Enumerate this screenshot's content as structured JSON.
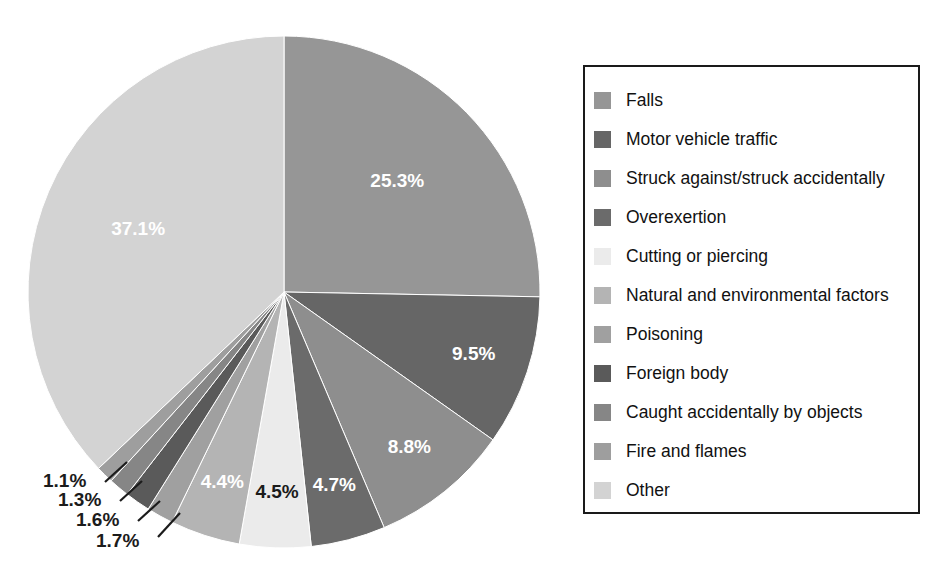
{
  "chart_data": {
    "type": "pie",
    "title": "",
    "subtitle": "",
    "xlabel": "",
    "ylabel": "",
    "grid": false,
    "legend_position": "right",
    "start_angle_deg": 0,
    "direction": "clockwise",
    "categories": [
      "Falls",
      "Motor vehicle traffic",
      "Struck against/struck accidentally",
      "Overexertion",
      "Cutting or piercing",
      "Natural and environmental factors",
      "Poisoning",
      "Foreign body",
      "Caught accidentally by objects",
      "Fire and flames",
      "Other"
    ],
    "values": [
      25.3,
      9.5,
      8.8,
      4.7,
      4.5,
      4.4,
      1.7,
      1.6,
      1.3,
      1.1,
      37.1
    ],
    "value_labels": [
      "25.3%",
      "9.5%",
      "8.8%",
      "4.7%",
      "4.5%",
      "4.4%",
      "1.7%",
      "1.6%",
      "1.3%",
      "1.1%",
      "37.1%"
    ],
    "colors": [
      "#969696",
      "#666666",
      "#8e8e8e",
      "#6b6b6b",
      "#ebebeb",
      "#b4b4b4",
      "#a0a0a0",
      "#5a5a5a",
      "#868686",
      "#9e9e9e",
      "#d3d3d3"
    ],
    "label_colors": [
      "#ffffff",
      "#ffffff",
      "#ffffff",
      "#ffffff",
      "#1b1b1b",
      "#ffffff",
      "#1b1b1b",
      "#1b1b1b",
      "#1b1b1b",
      "#1b1b1b",
      "#ffffff"
    ],
    "label_placement": [
      "inside",
      "inside",
      "inside",
      "inside",
      "inside",
      "inside",
      "callout",
      "callout",
      "callout",
      "callout",
      "inside"
    ]
  },
  "legend": {
    "items": [
      {
        "label": "Falls",
        "color": "#969696"
      },
      {
        "label": "Motor vehicle traffic",
        "color": "#666666"
      },
      {
        "label": "Struck against/struck accidentally",
        "color": "#8e8e8e"
      },
      {
        "label": "Overexertion",
        "color": "#6b6b6b"
      },
      {
        "label": "Cutting or piercing",
        "color": "#ebebeb"
      },
      {
        "label": "Natural and environmental factors",
        "color": "#b4b4b4"
      },
      {
        "label": "Poisoning",
        "color": "#a0a0a0"
      },
      {
        "label": "Foreign body",
        "color": "#5a5a5a"
      },
      {
        "label": "Caught accidentally by objects",
        "color": "#868686"
      },
      {
        "label": "Fire and flames",
        "color": "#9e9e9e"
      },
      {
        "label": "Other",
        "color": "#d3d3d3"
      }
    ]
  },
  "pie_geometry": {
    "center_x": 284,
    "center_y": 292,
    "radius": 256
  },
  "callouts": [
    {
      "text": "1.1%",
      "text_x": 43,
      "text_y": 487,
      "line_x1": 105,
      "line_y1": 482,
      "line_x2": 127,
      "line_y2": 462
    },
    {
      "text": "1.3%",
      "text_x": 58,
      "text_y": 506,
      "line_x1": 120,
      "line_y1": 501,
      "line_x2": 142,
      "line_y2": 481
    },
    {
      "text": "1.6%",
      "text_x": 76,
      "text_y": 526,
      "line_x1": 138,
      "line_y1": 521,
      "line_x2": 160,
      "line_y2": 501
    },
    {
      "text": "1.7%",
      "text_x": 96,
      "text_y": 547,
      "line_x1": 158,
      "line_y1": 537,
      "line_x2": 180,
      "line_y2": 513
    }
  ]
}
